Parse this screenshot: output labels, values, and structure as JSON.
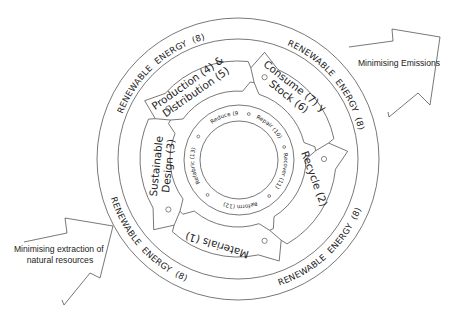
{
  "diagram": {
    "title": "",
    "center": [
      238,
      159
    ],
    "colors": {
      "stroke": "#555555",
      "text": "#222222",
      "background": "#ffffff"
    },
    "energy_ring": {
      "label": "RENEWABLE ENERGY (8)",
      "label_words": [
        "RENEWABLE",
        "ENERGY",
        "(8)"
      ],
      "occurrences": 4
    },
    "stages": [
      {
        "id": "production-distribution",
        "lines": [
          "Production (4) &",
          "Distribution (5)"
        ]
      },
      {
        "id": "consume-stock",
        "lines": [
          "Consume (7) y",
          "Stock (6)"
        ]
      },
      {
        "id": "recycle",
        "lines": [
          "Recycle (2)"
        ]
      },
      {
        "id": "materials",
        "lines": [
          "Materials (1)"
        ]
      },
      {
        "id": "sustainable-design",
        "lines": [
          "Sustainable",
          "Design (3)"
        ]
      }
    ],
    "inner_loop": [
      {
        "label": "Reduce (9)"
      },
      {
        "label": "Repair (10)"
      },
      {
        "label": "Recover (11)"
      },
      {
        "label": "Reform (12)"
      },
      {
        "label": "Refabric (13)"
      }
    ],
    "arrows": [
      {
        "id": "minimising-emissions",
        "lines": [
          "Minimising Emissions"
        ]
      },
      {
        "id": "minimising-extraction",
        "lines": [
          "Minimising extraction of",
          "natural resources"
        ]
      }
    ]
  }
}
